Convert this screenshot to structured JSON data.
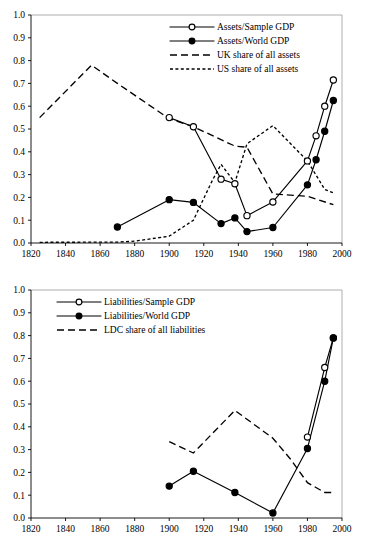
{
  "figure": {
    "panel_count": 2
  },
  "chart_data": [
    {
      "type": "line",
      "id": "assets-panel",
      "title": "",
      "xlabel": "",
      "ylabel": "",
      "xlim": [
        1820,
        2000
      ],
      "ylim": [
        0.0,
        1.0
      ],
      "grid": false,
      "legend_position": "top-right",
      "xticks": [
        1820,
        1840,
        1860,
        1880,
        1900,
        1920,
        1940,
        1960,
        1980,
        2000
      ],
      "xtick_labels": [
        "1820",
        "1840",
        "1860",
        "1880",
        "1900",
        "1920",
        "1940",
        "1960",
        "1980",
        "2000"
      ],
      "yticks": [
        0.0,
        0.1,
        0.2,
        0.3,
        0.4,
        0.5,
        0.6,
        0.7,
        0.8,
        0.9,
        1.0
      ],
      "ytick_labels": [
        "0.0",
        "0.1",
        "0.2",
        "0.3",
        "0.4",
        "0.5",
        "0.6",
        "0.7",
        "0.8",
        "0.9",
        "1.0"
      ],
      "series": [
        {
          "name": "Assets/Sample GDP",
          "style": "solid",
          "marker": "open-circle",
          "x": [
            1900,
            1914,
            1930,
            1938,
            1945,
            1960,
            1980,
            1985,
            1990,
            1995
          ],
          "values": [
            0.55,
            0.51,
            0.28,
            0.26,
            0.12,
            0.18,
            0.36,
            0.47,
            0.6,
            0.715
          ]
        },
        {
          "name": "Assets/World GDP",
          "style": "solid",
          "marker": "filled-circle",
          "x": [
            1870,
            1900,
            1914,
            1930,
            1938,
            1945,
            1960,
            1980,
            1985,
            1990,
            1995
          ],
          "values": [
            0.07,
            0.19,
            0.178,
            0.085,
            0.11,
            0.05,
            0.068,
            0.255,
            0.365,
            0.49,
            0.625
          ]
        },
        {
          "name": "UK share of all assets",
          "style": "long-dash",
          "marker": "none",
          "x": [
            1825,
            1855,
            1870,
            1900,
            1914,
            1938,
            1945,
            1960,
            1980,
            1995
          ],
          "values": [
            0.55,
            0.78,
            0.7,
            0.545,
            0.51,
            0.425,
            0.42,
            0.215,
            0.205,
            0.168
          ]
        },
        {
          "name": "US share of all assets",
          "style": "short-dash",
          "marker": "none",
          "x": [
            1825,
            1870,
            1880,
            1900,
            1914,
            1925,
            1930,
            1938,
            1945,
            1960,
            1980,
            1990,
            1995
          ],
          "values": [
            0.003,
            0.004,
            0.008,
            0.03,
            0.1,
            0.275,
            0.345,
            0.265,
            0.435,
            0.515,
            0.36,
            0.235,
            0.22
          ]
        }
      ]
    },
    {
      "type": "line",
      "id": "liabilities-panel",
      "title": "",
      "xlabel": "",
      "ylabel": "",
      "xlim": [
        1820,
        2000
      ],
      "ylim": [
        0.0,
        1.0
      ],
      "grid": false,
      "legend_position": "top-left",
      "xticks": [
        1820,
        1840,
        1860,
        1880,
        1900,
        1920,
        1940,
        1960,
        1980,
        2000
      ],
      "xtick_labels": [
        "1820",
        "1840",
        "1860",
        "1880",
        "1900",
        "1920",
        "1940",
        "1960",
        "1980",
        "2000"
      ],
      "yticks": [
        0.0,
        0.1,
        0.2,
        0.3,
        0.4,
        0.5,
        0.6,
        0.7,
        0.8,
        0.9,
        1.0
      ],
      "ytick_labels": [
        "0.0",
        "0.1",
        "0.2",
        "0.3",
        "0.4",
        "0.5",
        "0.6",
        "0.7",
        "0.8",
        "0.9",
        "1.0"
      ],
      "series": [
        {
          "name": "Liabilities/Sample GDP",
          "style": "solid",
          "marker": "open-circle",
          "x": [
            1980,
            1990,
            1995
          ],
          "values": [
            0.355,
            0.66,
            0.79
          ]
        },
        {
          "name": "Liabilities/World GDP",
          "style": "solid",
          "marker": "filled-circle",
          "x": [
            1900,
            1914,
            1938,
            1960,
            1980,
            1990,
            1995
          ],
          "values": [
            0.14,
            0.205,
            0.112,
            0.022,
            0.305,
            0.6,
            0.79
          ]
        },
        {
          "name": "LDC share of all liabilities",
          "style": "long-dash",
          "marker": "none",
          "x": [
            1900,
            1914,
            1938,
            1960,
            1970,
            1980,
            1990,
            1995
          ],
          "values": [
            0.335,
            0.285,
            0.472,
            0.35,
            0.26,
            0.155,
            0.112,
            0.112
          ]
        }
      ]
    }
  ]
}
